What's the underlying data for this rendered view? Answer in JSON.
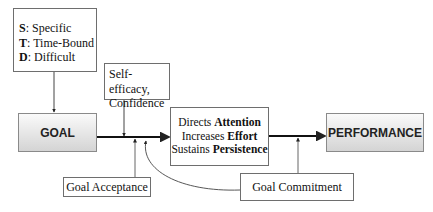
{
  "diagram": {
    "goal_attributes": [
      {
        "letter": "S",
        "text": ": Specific"
      },
      {
        "letter": "T",
        "text": ": Time-Bound"
      },
      {
        "letter": "D",
        "text": ": Difficult"
      }
    ],
    "self_efficacy": {
      "line1": "Self-efficacy,",
      "line2": "Confidence"
    },
    "goal": "GOAL",
    "mechanisms": [
      {
        "verb": "Directs ",
        "object": "Attention"
      },
      {
        "verb": "Increases ",
        "object": "Effort"
      },
      {
        "verb": "Sustains ",
        "object": "Persistence"
      }
    ],
    "performance": "PERFORMANCE",
    "goal_acceptance": "Goal Acceptance",
    "goal_commitment": "Goal Commitment",
    "colors": {
      "line": "#222222",
      "border": "#6e6e6e",
      "box_gradient_top": "#fafafa",
      "box_gradient_bottom": "#d4d4d4"
    }
  }
}
